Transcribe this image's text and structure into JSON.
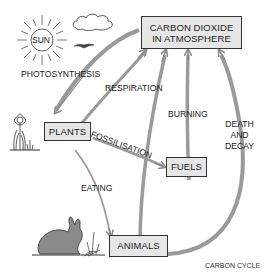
{
  "diagram": {
    "title": "CARBON CYCLE",
    "nodes": {
      "co2": {
        "line1": "CARBON DIOXIDE",
        "line2": "IN ATMOSPHERE"
      },
      "plants": "PLANTS",
      "fuels": "FUELS",
      "animals": "ANIMALS",
      "sun": "SUN"
    },
    "processes": {
      "photosynthesis": "PHOTOSYNTHESIS",
      "respiration": "RESPIRATION",
      "burning": "BURNING",
      "fossilisation": "FOSSILISATION",
      "eating": "EATING",
      "death_and_decay": {
        "line1": "DEATH",
        "line2": "AND",
        "line3": "DECAY"
      }
    },
    "edges": [
      {
        "from": "co2",
        "to": "plants",
        "label": "PHOTOSYNTHESIS"
      },
      {
        "from": "plants",
        "to": "co2",
        "label": "RESPIRATION"
      },
      {
        "from": "animals",
        "to": "co2",
        "label": "RESPIRATION"
      },
      {
        "from": "fuels",
        "to": "co2",
        "label": "BURNING"
      },
      {
        "from": "animals",
        "to": "co2",
        "label": "DEATH AND DECAY"
      },
      {
        "from": "plants",
        "to": "fuels",
        "label": "FOSSILISATION"
      },
      {
        "from": "plants",
        "to": "animals",
        "label": "EATING"
      }
    ],
    "icons": [
      "sun-icon",
      "cloud-icon",
      "bird-icon",
      "flower-icon",
      "grass-icon",
      "rabbit-icon"
    ],
    "colors": {
      "arrow": "#8a8a8a",
      "box_fill": "#e6e6e6",
      "box_border": "#333333",
      "text": "#222222"
    }
  }
}
